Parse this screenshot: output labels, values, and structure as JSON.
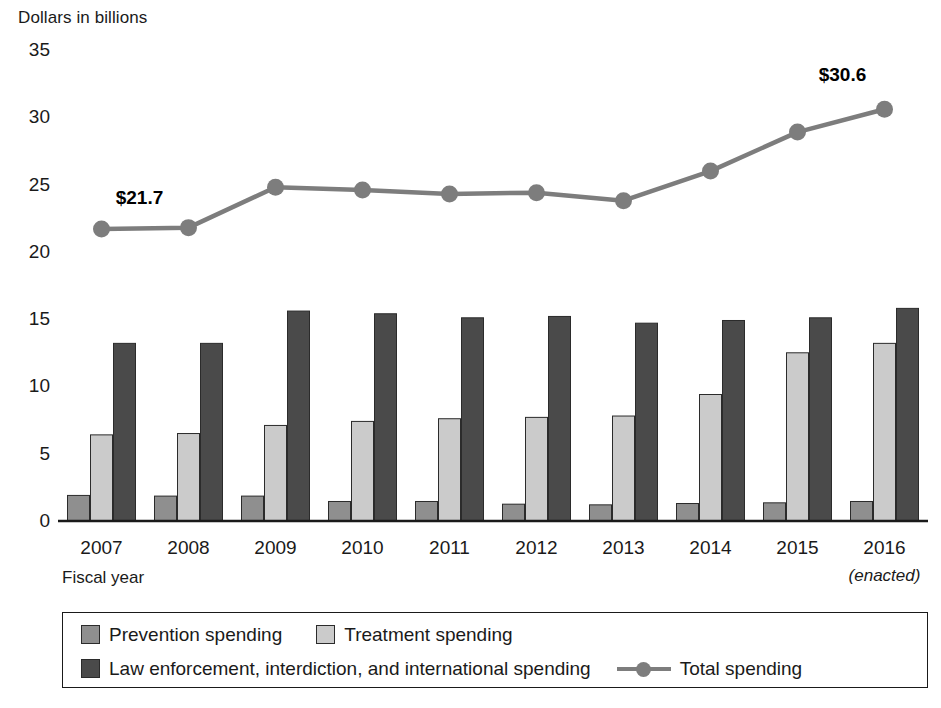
{
  "chart_data": {
    "type": "bar",
    "title": "",
    "ylabel": "Dollars in billions",
    "xlabel": "Fiscal year",
    "ylim": [
      0,
      35
    ],
    "yticks": [
      0,
      5,
      10,
      15,
      20,
      25,
      30,
      35
    ],
    "grid": false,
    "legend_position": "bottom",
    "categories": [
      "2007",
      "2008",
      "2009",
      "2010",
      "2011",
      "2012",
      "2013",
      "2014",
      "2015",
      "2016"
    ],
    "category_notes": [
      "",
      "",
      "",
      "",
      "",
      "",
      "",
      "",
      "",
      "(enacted)"
    ],
    "series": [
      {
        "name": "Prevention spending",
        "type": "bar",
        "color": "#8f8f8f",
        "values": [
          1.9,
          1.85,
          1.85,
          1.45,
          1.45,
          1.25,
          1.2,
          1.3,
          1.35,
          1.45
        ]
      },
      {
        "name": "Treatment spending",
        "type": "bar",
        "color": "#cbcbcb",
        "values": [
          6.4,
          6.5,
          7.1,
          7.4,
          7.6,
          7.7,
          7.8,
          9.4,
          12.5,
          13.2
        ]
      },
      {
        "name": "Law enforcement, interdiction, and international spending",
        "type": "bar",
        "color": "#4a4a4a",
        "values": [
          13.2,
          13.2,
          15.6,
          15.4,
          15.1,
          15.2,
          14.7,
          14.9,
          15.1,
          15.8
        ]
      },
      {
        "name": "Total spending",
        "type": "line",
        "color": "#7d7d7d",
        "values": [
          21.7,
          21.8,
          24.8,
          24.6,
          24.3,
          24.4,
          23.8,
          26.0,
          28.9,
          30.6
        ]
      }
    ],
    "annotations": [
      {
        "text": "$21.7",
        "category": "2007",
        "value": 21.7
      },
      {
        "text": "$30.6",
        "category": "2016",
        "value": 30.6
      }
    ]
  },
  "legend": {
    "items": [
      {
        "label": "Prevention spending",
        "marker": "square-swatch",
        "color": "#8f8f8f"
      },
      {
        "label": "Treatment spending",
        "marker": "square-swatch",
        "color": "#cbcbcb"
      },
      {
        "label": "Law enforcement, interdiction, and international spending",
        "marker": "square-swatch",
        "color": "#4a4a4a"
      },
      {
        "label": "Total spending",
        "marker": "line-with-dot",
        "color": "#7d7d7d"
      }
    ]
  }
}
